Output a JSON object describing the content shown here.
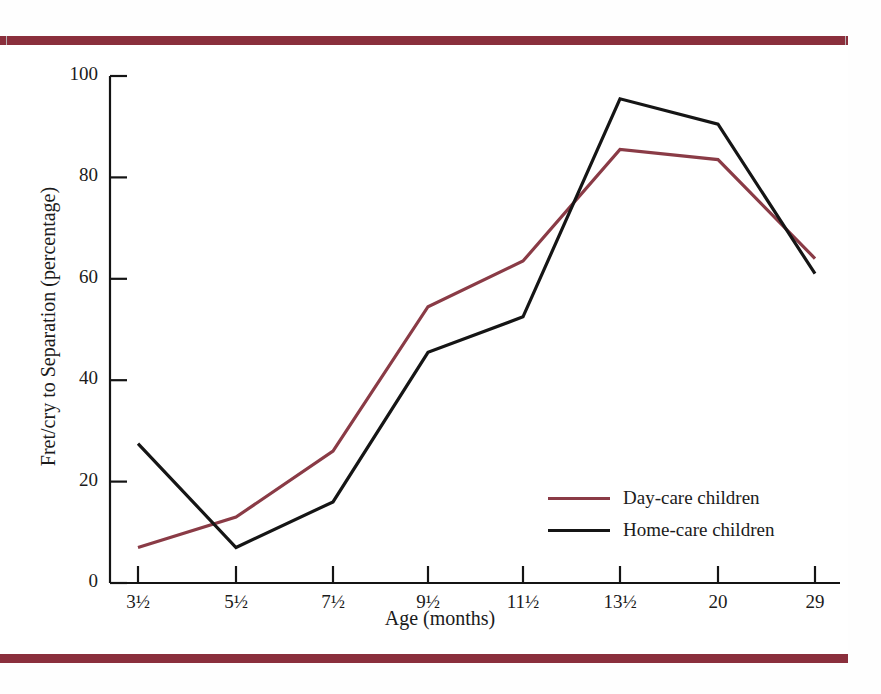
{
  "figure": {
    "frame_color": "#8a2f3c",
    "background": "#ffffff"
  },
  "chart_data": {
    "type": "line",
    "title": "",
    "xlabel": "Age (months)",
    "ylabel": "Fret/cry to Separation (percentage)",
    "categories": [
      "3½",
      "5½",
      "7½",
      "9½",
      "11½",
      "13½",
      "20",
      "29"
    ],
    "x_tick_labels": [
      "3½",
      "5½",
      "7½",
      "9½",
      "11½",
      "13½",
      "20",
      "29"
    ],
    "y_tick_labels": [
      "0",
      "20",
      "40",
      "60",
      "80",
      "100"
    ],
    "y_ticks": [
      0,
      20,
      40,
      60,
      80,
      100
    ],
    "ylim": [
      0,
      100
    ],
    "grid": false,
    "legend_position": "center-right",
    "series": [
      {
        "name": "Day-care children",
        "color": "#8a3b46",
        "values": [
          7,
          13,
          26,
          54.5,
          63.5,
          85.5,
          83.5,
          64
        ]
      },
      {
        "name": "Home-care children",
        "color": "#151515",
        "values": [
          27.5,
          7,
          16,
          45.5,
          52.5,
          95.5,
          90.5,
          61
        ]
      }
    ]
  },
  "legend": {
    "items": [
      {
        "label": "Day-care children",
        "color": "#8a3b46"
      },
      {
        "label": "Home-care children",
        "color": "#151515"
      }
    ]
  }
}
